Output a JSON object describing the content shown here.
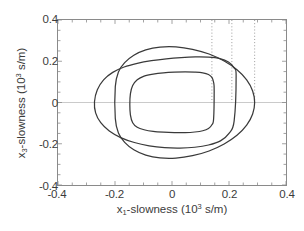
{
  "chart_data": {
    "type": "line",
    "title": "",
    "xlabel_parts": {
      "var": "x",
      "sub": "1",
      "text": "-slowness (10",
      "sup": "3",
      "tail": " s/m)"
    },
    "ylabel_parts": {
      "var": "x",
      "sub": "3",
      "text": "-slowness (10",
      "sup": "3",
      "tail": " s/m)"
    },
    "xlabel": "x1-slowness (10^3 s/m)",
    "ylabel": "x3-slowness (10^3 s/m)",
    "xlim": [
      -0.4,
      0.4
    ],
    "ylim": [
      -0.4,
      0.4
    ],
    "xticks": [
      -0.4,
      -0.2,
      0,
      0.2,
      0.4
    ],
    "xticklabels": [
      "-0.4",
      "-0.2",
      "0",
      "0.2",
      "0.4"
    ],
    "yticks": [
      -0.4,
      -0.2,
      0,
      0.2,
      0.4
    ],
    "yticklabels": [
      "-0.4",
      "-0.2",
      "0",
      "0.2",
      "0.4"
    ],
    "grid": false,
    "legend": "none",
    "line_color": "#3a3a3a",
    "axis_color": "#8a8a8a",
    "zeroline_color": "#c9c9c9",
    "guide_color": "#9a9a9a",
    "guide_style": "dotted",
    "guides_x": [
      0.14,
      0.21,
      0.29
    ],
    "series": [
      {
        "name": "curve-outer",
        "closed": true,
        "x": [
          0.29,
          0.283,
          0.262,
          0.228,
          0.183,
          0.13,
          0.072,
          0.014,
          -0.042,
          -0.092,
          -0.134,
          -0.166,
          -0.188,
          -0.199,
          -0.199,
          -0.188,
          -0.166,
          -0.134,
          -0.092,
          -0.042,
          0.014,
          0.072,
          0.13,
          0.183,
          0.228,
          0.262,
          0.283
        ],
        "y": [
          0.0,
          0.056,
          0.11,
          0.159,
          0.201,
          0.235,
          0.258,
          0.27,
          0.269,
          0.255,
          0.229,
          0.193,
          0.148,
          0.077,
          -0.077,
          -0.148,
          -0.193,
          -0.229,
          -0.255,
          -0.269,
          -0.27,
          -0.258,
          -0.235,
          -0.201,
          -0.159,
          -0.11,
          -0.056
        ]
      },
      {
        "name": "curve-middle",
        "closed": true,
        "x": [
          0.225,
          0.218,
          0.198,
          0.168,
          0.128,
          0.082,
          0.032,
          -0.02,
          -0.072,
          -0.122,
          -0.168,
          -0.208,
          -0.24,
          -0.262,
          -0.272,
          -0.268,
          -0.25,
          -0.22,
          -0.18,
          -0.132,
          -0.08,
          -0.026,
          0.028,
          0.08,
          0.128,
          0.17,
          0.2,
          0.218
        ],
        "y": [
          0.13,
          0.168,
          0.196,
          0.213,
          0.22,
          0.221,
          0.218,
          0.212,
          0.203,
          0.19,
          0.172,
          0.146,
          0.11,
          0.062,
          0.004,
          -0.05,
          -0.098,
          -0.138,
          -0.17,
          -0.194,
          -0.21,
          -0.219,
          -0.221,
          -0.217,
          -0.206,
          -0.186,
          -0.15,
          -0.09
        ]
      },
      {
        "name": "curve-inner",
        "closed": true,
        "x": [
          0.148,
          0.146,
          0.14,
          0.128,
          0.108,
          0.08,
          0.046,
          0.008,
          -0.03,
          -0.066,
          -0.098,
          -0.122,
          -0.138,
          -0.146,
          -0.148,
          -0.146,
          -0.138,
          -0.122,
          -0.098,
          -0.066,
          -0.03,
          0.008,
          0.046,
          0.08,
          0.108,
          0.128,
          0.14,
          0.146
        ],
        "y": [
          0.06,
          0.098,
          0.122,
          0.136,
          0.144,
          0.147,
          0.148,
          0.147,
          0.144,
          0.138,
          0.128,
          0.11,
          0.082,
          0.042,
          -0.01,
          -0.06,
          -0.098,
          -0.12,
          -0.132,
          -0.14,
          -0.144,
          -0.146,
          -0.146,
          -0.143,
          -0.137,
          -0.126,
          -0.108,
          -0.08
        ]
      }
    ]
  }
}
